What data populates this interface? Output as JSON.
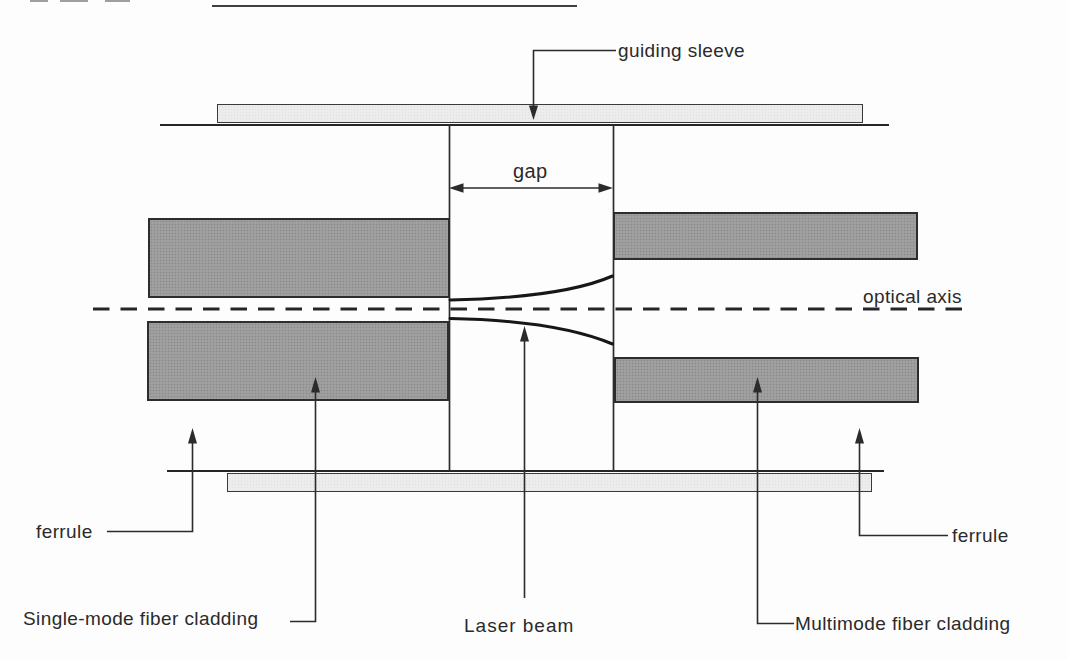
{
  "diagram": {
    "labels": {
      "guiding_sleeve": "guiding sleeve",
      "gap": "gap",
      "optical_axis": "optical axis",
      "ferrule_left": "ferrule",
      "ferrule_right": "ferrule",
      "single_mode_cladding": "Single-mode fiber cladding",
      "laser_beam": "Laser beam",
      "multimode_cladding": "Multimode fiber cladding"
    },
    "colors": {
      "background": "#fdfdfd",
      "line": "#2b2b2b",
      "text": "#2a2a2a",
      "cladding_fill": "#9b9b9b",
      "cladding_dot": "#898989",
      "sleeve_fill": "#ececec",
      "sleeve_dot": "#dfdfdf",
      "beam": "#171717"
    }
  }
}
